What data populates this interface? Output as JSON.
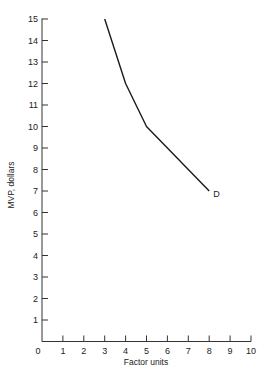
{
  "chart_data": {
    "type": "line",
    "title": "",
    "xlabel": "Factor units",
    "ylabel": "MVP, dollars",
    "xlim": [
      0,
      10
    ],
    "ylim": [
      0,
      15
    ],
    "x_ticks": [
      0,
      1,
      2,
      3,
      4,
      5,
      6,
      7,
      8,
      9,
      10
    ],
    "y_ticks": [
      1,
      2,
      3,
      4,
      5,
      6,
      7,
      8,
      9,
      10,
      11,
      12,
      13,
      14,
      15
    ],
    "grid": false,
    "legend": null,
    "series": [
      {
        "name": "D",
        "x": [
          3,
          4,
          5,
          8
        ],
        "y": [
          15,
          12,
          10,
          7
        ]
      }
    ],
    "annotations": [
      {
        "text": "D",
        "x": 8,
        "y": 7
      }
    ],
    "colors": {
      "line": "#1a1a1a",
      "axis": "#333333"
    }
  }
}
